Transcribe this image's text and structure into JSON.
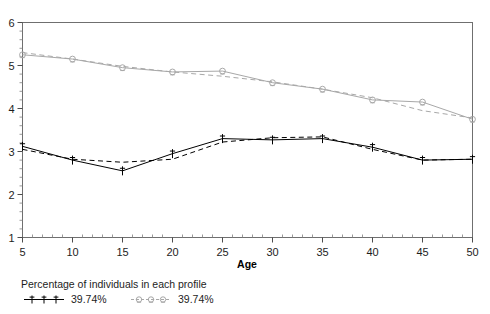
{
  "chart_data": {
    "type": "line",
    "title": "",
    "subtitle": "",
    "xlabel": "Age",
    "ylabel": "",
    "x": [
      5,
      10,
      15,
      20,
      25,
      30,
      35,
      40,
      45,
      50
    ],
    "xlim": [
      5,
      50
    ],
    "ylim": [
      1,
      6
    ],
    "xticks": [
      5,
      10,
      15,
      20,
      25,
      30,
      35,
      40,
      45,
      50
    ],
    "yticks": [
      1,
      2,
      3,
      4,
      5,
      6
    ],
    "xtick_labels": [
      "5",
      "10",
      "15",
      "20",
      "25",
      "30",
      "35",
      "40",
      "45",
      "50"
    ],
    "ytick_labels": [
      "1",
      "2",
      "3",
      "4",
      "5",
      "6"
    ],
    "minor_ticks": true,
    "grid": false,
    "legend_position": "below-left",
    "series": [
      {
        "name": "1",
        "label": "39.74%",
        "marker": "1",
        "color": "#000000",
        "style": "solid-observed",
        "values": [
          3.12,
          2.8,
          2.55,
          2.95,
          3.3,
          3.27,
          3.3,
          3.1,
          2.8,
          2.82
        ]
      },
      {
        "name": "1-predicted",
        "label": "39.74%",
        "marker": "none",
        "color": "#000000",
        "style": "dashed-predicted",
        "values": [
          3.05,
          2.82,
          2.75,
          2.82,
          3.22,
          3.32,
          3.34,
          3.05,
          2.8,
          2.82
        ]
      },
      {
        "name": "2",
        "label": "39.74%",
        "marker": "2",
        "color": "#a8a8a8",
        "style": "solid-observed",
        "values": [
          5.25,
          5.15,
          4.95,
          4.85,
          4.87,
          4.6,
          4.45,
          4.2,
          4.15,
          3.75
        ]
      },
      {
        "name": "2-predicted",
        "label": "39.74%",
        "marker": "none",
        "color": "#a8a8a8",
        "style": "dashed-predicted",
        "values": [
          5.3,
          5.15,
          4.98,
          4.85,
          4.75,
          4.62,
          4.45,
          4.25,
          3.95,
          3.78
        ]
      }
    ]
  },
  "axes": {
    "x_title": "Age",
    "y_title": "",
    "x_tick_labels": [
      "5",
      "10",
      "15",
      "20",
      "25",
      "30",
      "35",
      "40",
      "45",
      "50"
    ],
    "y_tick_labels": [
      "6",
      "5",
      "4",
      "3",
      "2",
      "1"
    ]
  },
  "legend": {
    "title": "Percentage of individuals in each profile",
    "entries": [
      {
        "symbol": "1",
        "value": "39.74%",
        "color": "#000000"
      },
      {
        "symbol": "2",
        "value": "39.74%",
        "color": "#a8a8a8"
      }
    ]
  }
}
